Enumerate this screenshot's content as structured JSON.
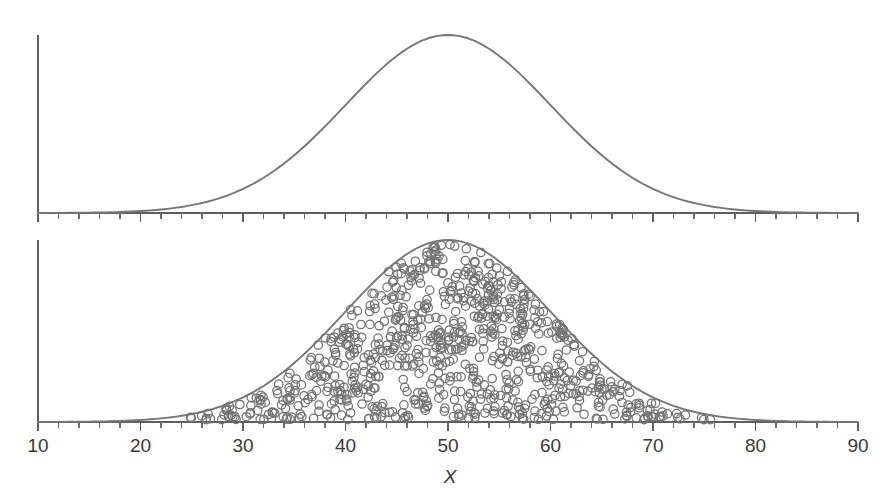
{
  "figure": {
    "axis_title": "X",
    "width": 892,
    "height": 497,
    "curve_color": "#777777",
    "circle_color": "#727272",
    "axis_color": "#5f5f5f",
    "text_color": "#3a3a3a"
  },
  "chart_data": {
    "type": "area",
    "title": "",
    "subtitle": "",
    "xlabel": "X",
    "ylabel": "",
    "xlim": [
      10,
      90
    ],
    "ylim": [
      0,
      1
    ],
    "grid": false,
    "legend": null,
    "x_ticks_major": [
      10,
      20,
      30,
      40,
      50,
      60,
      70,
      80,
      90
    ],
    "x_tick_labels": [
      "10",
      "20",
      "30",
      "40",
      "50",
      "60",
      "70",
      "80",
      "90"
    ],
    "x_minor_tick_step": 2,
    "distribution": {
      "name": "normal",
      "mean": 50,
      "sd": 10,
      "peak_x": 50
    },
    "panels": [
      {
        "name": "population-density-curve",
        "description": "Smooth normal density curve",
        "shows_points": false,
        "n_points": 0
      },
      {
        "name": "sample-observations-curve",
        "description": "Same normal density curve filled with individual observations drawn as small open circles",
        "shows_points": true,
        "n_points": 820
      }
    ],
    "series": [
      {
        "name": "Normal density",
        "x": [
          10,
          12,
          14,
          16,
          18,
          20,
          22,
          24,
          26,
          28,
          30,
          32,
          34,
          36,
          38,
          40,
          42,
          44,
          46,
          48,
          50,
          52,
          54,
          56,
          58,
          60,
          62,
          64,
          66,
          68,
          70,
          72,
          74,
          76,
          78,
          80,
          82,
          84,
          86,
          88,
          90
        ],
        "values": [
          0.0,
          0.0,
          0.0,
          0.0,
          0.001,
          0.001,
          0.004,
          0.009,
          0.018,
          0.033,
          0.054,
          0.083,
          0.12,
          0.163,
          0.21,
          0.261,
          0.368,
          0.487,
          0.607,
          0.726,
          0.8,
          0.726,
          0.607,
          0.487,
          0.368,
          0.261,
          0.21,
          0.163,
          0.12,
          0.083,
          0.054,
          0.033,
          0.018,
          0.009,
          0.004,
          0.001,
          0.001,
          0.0,
          0.0,
          0.0,
          0.0
        ]
      }
    ]
  }
}
